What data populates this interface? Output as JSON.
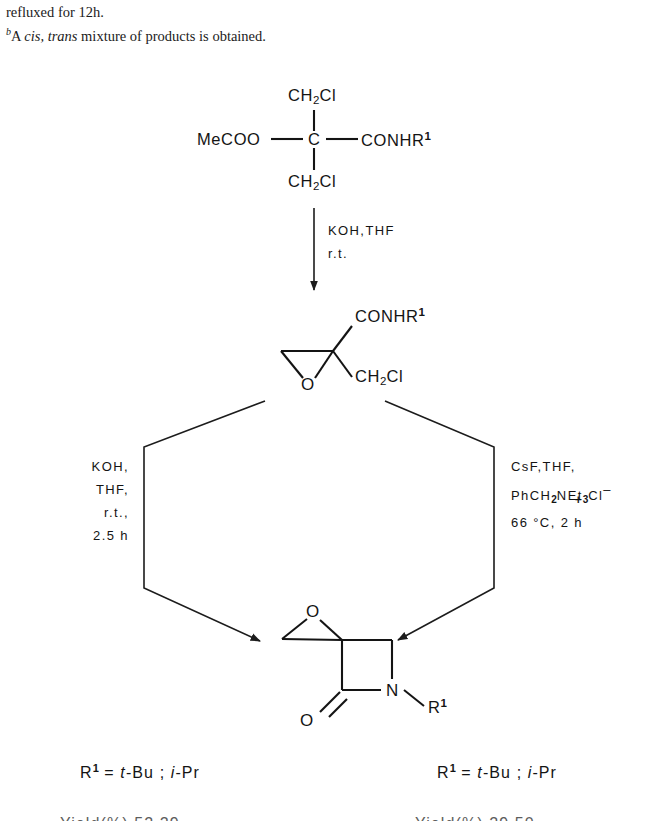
{
  "document": {
    "footnotes": [
      {
        "mark": "",
        "text_before": "refluxed for 12h.",
        "italic": "",
        "text_after": ""
      },
      {
        "mark": "b",
        "text_before": "A ",
        "italic": "cis, trans",
        "text_after": " mixture of products is obtained."
      }
    ]
  },
  "scheme": {
    "starting_material": {
      "name": "dichloro-diester-amide",
      "labels": {
        "top": "CH2Cl",
        "left": "MeCOO",
        "center": "C",
        "right": "CONHR1",
        "bottom": "CH2Cl"
      },
      "top_text": "CH",
      "top_sub": "2",
      "top_tail": "Cl",
      "left_text": "MeCOO",
      "center_text": "C",
      "right_text": "CONHR",
      "right_sup": "1",
      "bottom_text": "CH",
      "bottom_sub": "2",
      "bottom_tail": "Cl"
    },
    "step1": {
      "name": "epoxidation",
      "line1": "KOH,THF",
      "line2": "r.t."
    },
    "intermediate": {
      "name": "glycidamide-chloromethyl",
      "amide_text": "CONHR",
      "amide_sup": "1",
      "chloromethyl_text": "CH",
      "chloromethyl_sub": "2",
      "chloromethyl_tail": "Cl",
      "epoxide_oxygen": "O"
    },
    "left_branch": {
      "name": "koh-cyclization",
      "lines": [
        "KOH,",
        "THF,",
        "r.t.,",
        "2.5 h"
      ]
    },
    "right_branch": {
      "name": "csf-phase-transfer-cyclization",
      "line1": "CsF,THF,",
      "line2_a": "PhCH",
      "line2_sub1": "2",
      "line2_b": "NEt",
      "line2_sub2": "3",
      "line2_c": "Cl",
      "line2_charge_plus": "+",
      "line2_charge_minus": "–",
      "line3": "66 °C, 2 h"
    },
    "product": {
      "name": "spiro-epoxy-azetidinone",
      "epoxide_oxygen": "O",
      "carbonyl_oxygen": "O",
      "nitrogen": "N",
      "substituent": "R",
      "substituent_sup": "1"
    },
    "legend_left": {
      "prefix": "R",
      "sup": "1",
      "equals": "=",
      "value_a_italic": "t",
      "value_a": "-Bu",
      "separator": ";",
      "value_b_italic": "i",
      "value_b": "-Pr"
    },
    "legend_right": {
      "prefix": "R",
      "sup": "1",
      "equals": "=",
      "value_a_italic": "t",
      "value_a": "-Bu",
      "separator": ";",
      "value_b_italic": "i",
      "value_b": "-Pr"
    },
    "yield_row_left": "Yield(%)     52        29",
    "yield_row_right": "Yield(%)     29        50"
  }
}
